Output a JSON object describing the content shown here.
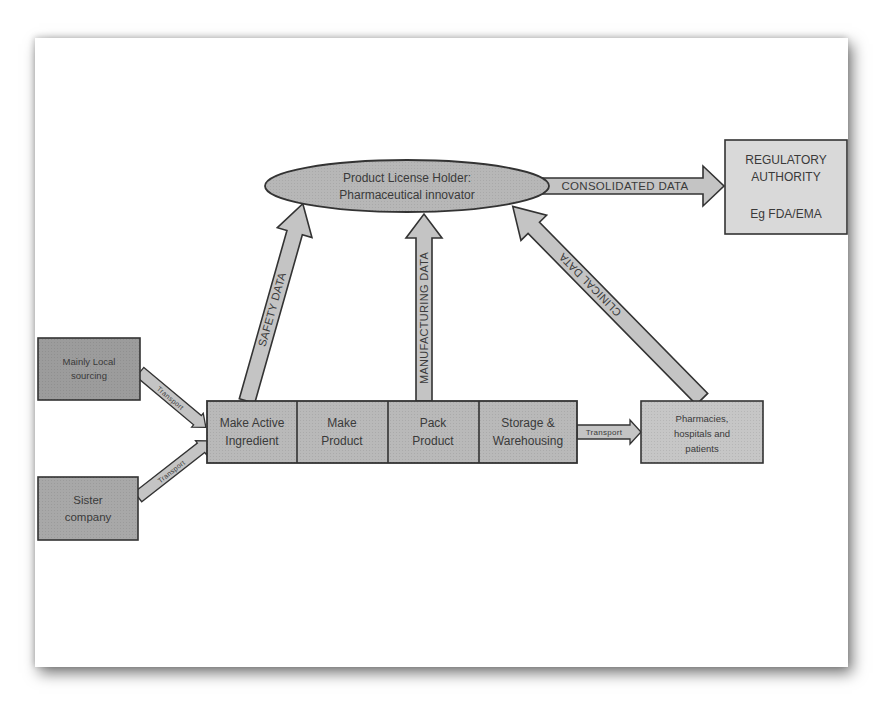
{
  "diagram": {
    "colors": {
      "box_dark": "#9c9c9c",
      "box_mid": "#b9b9b9",
      "box_light": "#d9d9d9",
      "arrow_fill": "#c4c4c4",
      "ellipse_fill": "#b7b7b7",
      "stroke": "#333333",
      "text": "#3a3a3a"
    },
    "nodes": {
      "license_holder": {
        "line1": "Product License Holder:",
        "line2": "Pharmaceutical innovator"
      },
      "regulatory": {
        "line1": "REGULATORY",
        "line2": "AUTHORITY",
        "line3": "Eg FDA/EMA"
      },
      "local_sourcing": {
        "line1": "Mainly Local",
        "line2": "sourcing"
      },
      "sister_company": {
        "line1": "Sister",
        "line2": "company"
      },
      "process_steps": [
        {
          "line1": "Make Active",
          "line2": "Ingredient"
        },
        {
          "line1": "Make",
          "line2": "Product"
        },
        {
          "line1": "Pack",
          "line2": "Product"
        },
        {
          "line1": "Storage &",
          "line2": "Warehousing"
        }
      ],
      "pharmacies": {
        "line1": "Pharmacies,",
        "line2": "hospitals and",
        "line3": "patients"
      }
    },
    "arrows": {
      "consolidated": "CONSOLIDATED DATA",
      "safety": "SAFETY DATA",
      "manufacturing": "MANUFACTURING DATA",
      "clinical": "CLINICAL DATA",
      "transport_local": "Transport",
      "transport_sister": "Transport",
      "transport_pharmacies": "Transport"
    }
  }
}
